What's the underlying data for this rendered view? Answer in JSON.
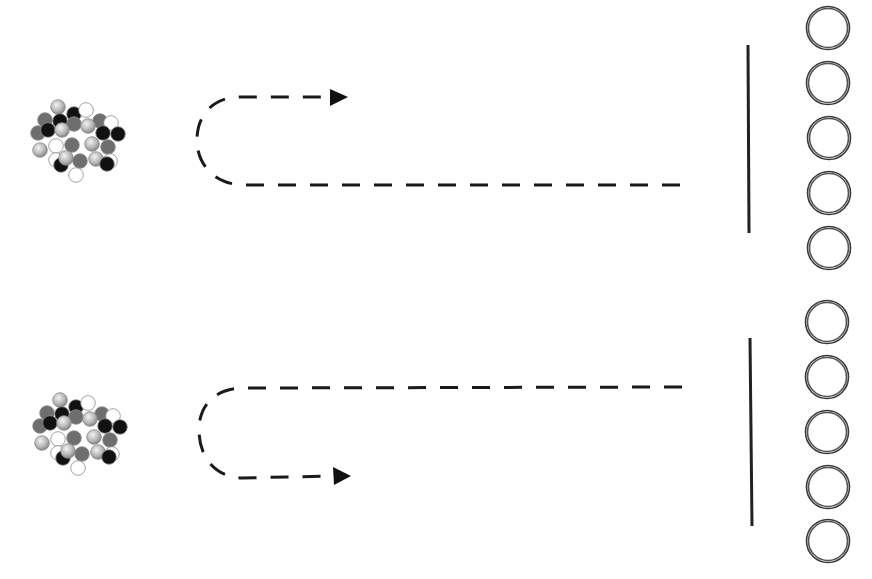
{
  "diagram": {
    "colors": {
      "background": "#ffffff",
      "line": "#1a1a1a",
      "ring": "#333333",
      "particle_black": "#111111",
      "particle_dark_gray": "#6e6e6e",
      "particle_light": "#bdbdbd",
      "particle_white": "#ffffff"
    },
    "rows": [
      {
        "id": "top",
        "cluster_origin": [
          0,
          0
        ],
        "path_direction": "return-upper",
        "arrow_tip": [
          348,
          97
        ],
        "barrier": {
          "x": 748,
          "y1": 45,
          "y2": 233
        },
        "rings": [
          [
            828,
            28
          ],
          [
            828,
            83
          ],
          [
            829,
            138
          ],
          [
            829,
            193
          ],
          [
            829,
            248
          ]
        ]
      },
      {
        "id": "bottom",
        "cluster_origin": [
          2,
          293
        ],
        "path_direction": "return-lower",
        "arrow_tip": [
          350,
          476
        ],
        "barrier": {
          "x": 751,
          "y1": 338,
          "y2": 526
        },
        "rings": [
          [
            827,
            322
          ],
          [
            827,
            377
          ],
          [
            827,
            432
          ],
          [
            828,
            487
          ],
          [
            828,
            541
          ]
        ]
      }
    ],
    "particles": [
      {
        "x": 58,
        "y": 107,
        "t": "light"
      },
      {
        "x": 74,
        "y": 114,
        "t": "black"
      },
      {
        "x": 86,
        "y": 110,
        "t": "white"
      },
      {
        "x": 45,
        "y": 120,
        "t": "dark"
      },
      {
        "x": 100,
        "y": 121,
        "t": "dark"
      },
      {
        "x": 111,
        "y": 123,
        "t": "white"
      },
      {
        "x": 60,
        "y": 121,
        "t": "black"
      },
      {
        "x": 74,
        "y": 124,
        "t": "dark"
      },
      {
        "x": 88,
        "y": 126,
        "t": "light"
      },
      {
        "x": 38,
        "y": 133,
        "t": "dark"
      },
      {
        "x": 48,
        "y": 130,
        "t": "black"
      },
      {
        "x": 62,
        "y": 130,
        "t": "light"
      },
      {
        "x": 103,
        "y": 133,
        "t": "black"
      },
      {
        "x": 118,
        "y": 134,
        "t": "black"
      },
      {
        "x": 56,
        "y": 146,
        "t": "white"
      },
      {
        "x": 72,
        "y": 145,
        "t": "dark"
      },
      {
        "x": 92,
        "y": 144,
        "t": "light"
      },
      {
        "x": 108,
        "y": 147,
        "t": "dark"
      },
      {
        "x": 40,
        "y": 150,
        "t": "light"
      },
      {
        "x": 56,
        "y": 160,
        "t": "white"
      },
      {
        "x": 61,
        "y": 165,
        "t": "black"
      },
      {
        "x": 66,
        "y": 158,
        "t": "light"
      },
      {
        "x": 80,
        "y": 161,
        "t": "dark"
      },
      {
        "x": 96,
        "y": 159,
        "t": "light"
      },
      {
        "x": 110,
        "y": 161,
        "t": "white"
      },
      {
        "x": 107,
        "y": 164,
        "t": "black"
      },
      {
        "x": 76,
        "y": 175,
        "t": "white"
      }
    ]
  }
}
